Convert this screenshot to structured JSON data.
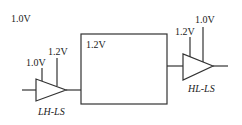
{
  "diagram": {
    "global_domain_label": "1.0V",
    "core_block": {
      "label": "1.2V"
    },
    "lh_shifter": {
      "name": "LH-LS",
      "supply_in": "1.0V",
      "supply_out": "1.2V"
    },
    "hl_shifter": {
      "name": "HL-LS",
      "supply_in": "1.2V",
      "supply_out": "1.0V"
    },
    "colors": {
      "line": "#333333",
      "text": "#222222"
    }
  }
}
